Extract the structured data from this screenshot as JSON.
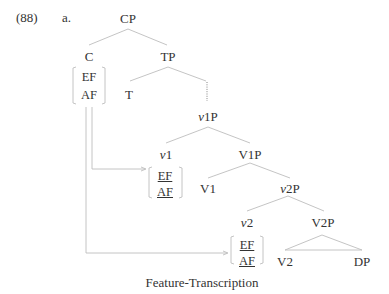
{
  "example": {
    "number": "(88)",
    "letter": "a."
  },
  "tree": {
    "root": "CP",
    "c": "C",
    "tp": "TP",
    "t": "T",
    "v1p_italic": "v",
    "v1p_rest": "1P",
    "v1_italic": "v",
    "v1_rest": "1",
    "V1P": "V1P",
    "V1": "V1",
    "v2p_italic": "v",
    "v2p_rest": "2P",
    "v2_italic": "v",
    "v2_rest": "2",
    "V2P": "V2P",
    "V2": "V2",
    "DP": "DP"
  },
  "features": {
    "c": {
      "ef": "EF",
      "af": "AF",
      "underlined": false
    },
    "v1": {
      "ef": "EF",
      "af": "AF",
      "underlined": true
    },
    "v2": {
      "ef": "EF",
      "af": "AF",
      "underlined": true
    }
  },
  "caption": "Feature-Transcription",
  "colors": {
    "lines": "#bbbbbb",
    "text": "#333333"
  }
}
